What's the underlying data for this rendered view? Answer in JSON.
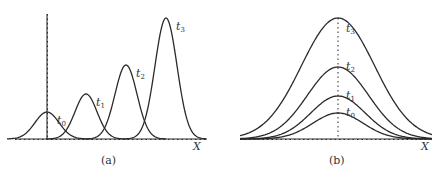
{
  "figure": {
    "panel_a": {
      "caption": "(a)",
      "x_axis_label": "X",
      "curves": [
        {
          "label": "t",
          "sub": "0",
          "center_x": 47,
          "peak_y": 112,
          "sigma": 12
        },
        {
          "label": "t",
          "sub": "1",
          "center_x": 86,
          "peak_y": 94,
          "sigma": 11
        },
        {
          "label": "t",
          "sub": "2",
          "center_x": 126,
          "peak_y": 65,
          "sigma": 11
        },
        {
          "label": "t",
          "sub": "3",
          "center_x": 166,
          "peak_y": 18,
          "sigma": 11
        }
      ]
    },
    "panel_b": {
      "caption": "(b)",
      "x_axis_label": "X",
      "curves": [
        {
          "label": "t",
          "sub": "0",
          "peak_y": 113
        },
        {
          "label": "t",
          "sub": "1",
          "peak_y": 96
        },
        {
          "label": "t",
          "sub": "2",
          "peak_y": 67
        },
        {
          "label": "t",
          "sub": "3",
          "peak_y": 18
        }
      ]
    }
  }
}
